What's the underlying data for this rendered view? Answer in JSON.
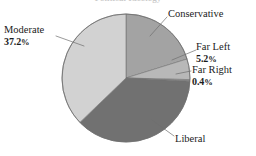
{
  "title_clipped": "Political Ideology",
  "chart_data": {
    "type": "pie",
    "title": "",
    "xlabel": "",
    "ylabel": "",
    "legend_position": "none",
    "grid": false,
    "labels": [
      "Conservative",
      "Far Left",
      "Far Right",
      "Liberal",
      "Moderate"
    ],
    "categories": [
      "Conservative",
      "Far Left",
      "Far Right",
      "Liberal",
      "Moderate"
    ],
    "values": [
      20.2,
      5.2,
      0.4,
      37.0,
      37.2
    ],
    "slices": [
      {
        "name": "Conservative",
        "label": "Conservative",
        "value": 20.2,
        "value_text": "",
        "color": "#a3a3a3",
        "start_angle": 0,
        "end_angle": 72.7
      },
      {
        "name": "Far Left",
        "label": "Far Left",
        "value": 5.2,
        "value_text": "5.2%",
        "color": "#b8b8b8",
        "start_angle": 72.7,
        "end_angle": 91.4
      },
      {
        "name": "Far Right",
        "label": "Far Right",
        "value": 0.4,
        "value_text": "0.4%",
        "color": "#8f8f8f",
        "start_angle": 91.4,
        "end_angle": 92.8
      },
      {
        "name": "Liberal",
        "label": "Liberal",
        "value": 37.0,
        "value_text": "",
        "color": "#717171",
        "start_angle": 92.8,
        "end_angle": 226.0
      },
      {
        "name": "Moderate",
        "label": "Moderate",
        "value": 37.2,
        "value_text": "37.2%",
        "color": "#d2d2d2",
        "start_angle": 226.0,
        "end_angle": 360
      }
    ],
    "percent_symbol": "%"
  },
  "labels": {
    "conservative": {
      "name": "Conservative",
      "percent": ""
    },
    "far_left": {
      "name": "Far Left",
      "percent": "5.2",
      "symbol": "%"
    },
    "far_right": {
      "name": "Far Right",
      "percent": "0.4",
      "symbol": "%"
    },
    "moderate": {
      "name": "Moderate",
      "percent": "37.2",
      "symbol": "%"
    },
    "liberal": {
      "name": "Liberal",
      "percent": ""
    }
  },
  "colors": {
    "moderate": "#d2d2d2",
    "conservative": "#a3a3a3",
    "far_left": "#b8b8b8",
    "far_right": "#8f8f8f",
    "liberal": "#717171",
    "outline": "#6b6b6b",
    "leader_line": "#6f6f6f",
    "background": "#ffffff",
    "text": "#1b1b1b"
  }
}
